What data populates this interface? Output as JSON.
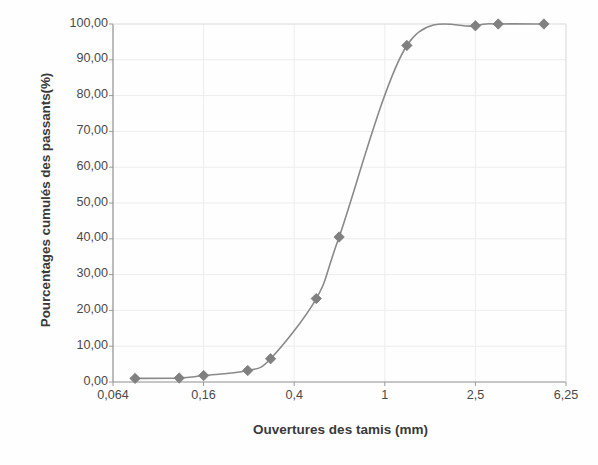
{
  "chart_data": {
    "type": "line",
    "title": "",
    "subtitle": "",
    "xlabel": "Ouvertures des tamis (mm)",
    "ylabel": "Pourcentages cumulés des passants(%)",
    "xscale": "log",
    "xlim": [
      0.064,
      6.25
    ],
    "ylim": [
      0,
      100
    ],
    "grid": true,
    "legend": null,
    "x_tick_labels": [
      "0,064",
      "0,16",
      "0,4",
      "1",
      "2,5",
      "6,25"
    ],
    "x_tick_values": [
      0.064,
      0.16,
      0.4,
      1,
      2.5,
      6.25
    ],
    "y_tick_labels": [
      "0,00",
      "10,00",
      "20,00",
      "30,00",
      "40,00",
      "50,00",
      "60,00",
      "70,00",
      "80,00",
      "90,00",
      "100,00"
    ],
    "y_tick_values": [
      0,
      10,
      20,
      30,
      40,
      50,
      60,
      70,
      80,
      90,
      100
    ],
    "series": [
      {
        "name": "Courbe granulométrique",
        "marker": "diamond",
        "color": "#808080",
        "line_color": "#8a8a8a",
        "x": [
          0.08,
          0.125,
          0.16,
          0.25,
          0.315,
          0.5,
          0.63,
          1.25,
          2.5,
          3.15,
          5.0
        ],
        "y": [
          1.0,
          1.1,
          1.8,
          3.2,
          6.5,
          23.3,
          40.5,
          94.0,
          99.5,
          100.0,
          100.0
        ]
      }
    ]
  },
  "axes": {
    "y_title": "Pourcentages cumulés des passants(%)",
    "x_title": "Ouvertures des tamis (mm)"
  },
  "colors": {
    "marker": "#808080",
    "line": "#8a8a8a",
    "axis": "#9a9a9a",
    "grid": "#ededed",
    "text": "#3f3f3f",
    "background": "#ffffff"
  }
}
